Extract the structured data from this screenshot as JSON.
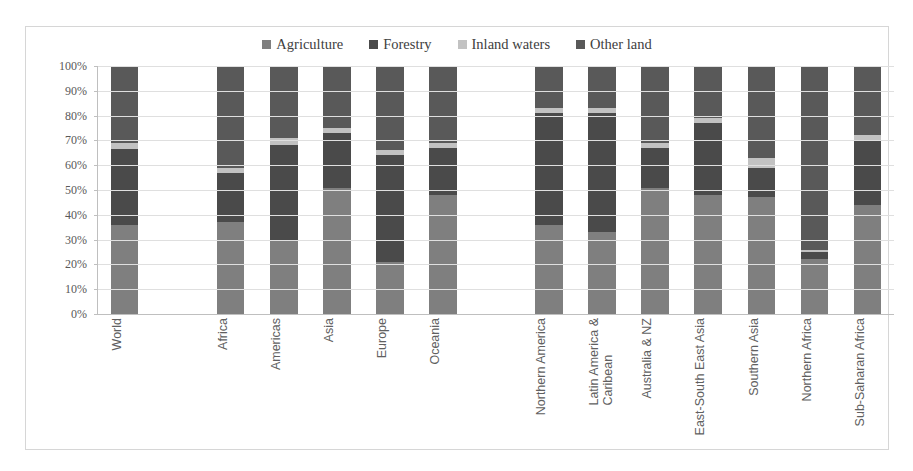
{
  "chart_data": {
    "type": "bar",
    "subtype": "stacked-percentage",
    "title": "",
    "xlabel": "",
    "ylabel": "",
    "ylim": [
      0,
      100
    ],
    "y_ticks": [
      "0%",
      "10%",
      "20%",
      "30%",
      "40%",
      "50%",
      "60%",
      "70%",
      "80%",
      "90%",
      "100%"
    ],
    "grid": true,
    "legend_position": "top",
    "categories": [
      "World",
      "",
      "Africa",
      "Americas",
      "Asia",
      "Europe",
      "Oceania",
      "",
      "Northern America",
      "Latin America &\nCaribean",
      "Australia & NZ",
      "East-South East Asia",
      "Southern Asia",
      "Northern Africa",
      "Sub-Saharan Africa"
    ],
    "series": [
      {
        "name": "Agriculture",
        "color": "#7F7F7F",
        "values": [
          36,
          null,
          37,
          30,
          51,
          21,
          48,
          null,
          36,
          33,
          51,
          48,
          47,
          22,
          44
        ]
      },
      {
        "name": "Forestry",
        "color": "#4A4A4A",
        "values": [
          30.5,
          null,
          20,
          38,
          22,
          43,
          19,
          null,
          45,
          48,
          16,
          29,
          12,
          3,
          26
        ]
      },
      {
        "name": "Inland waters",
        "color": "#C2C2C2",
        "values": [
          2.5,
          null,
          2,
          3,
          2,
          2,
          2,
          null,
          2,
          2,
          2,
          2,
          4,
          1,
          2
        ]
      },
      {
        "name": "Other land",
        "color": "#595959",
        "values": [
          31,
          null,
          41,
          29,
          25,
          34,
          31,
          null,
          17,
          17,
          31,
          21,
          37,
          74,
          28
        ]
      }
    ]
  },
  "legend": {
    "items": [
      {
        "label": "Agriculture",
        "color": "#7F7F7F"
      },
      {
        "label": "Forestry",
        "color": "#4A4A4A"
      },
      {
        "label": "Inland waters",
        "color": "#C2C2C2"
      },
      {
        "label": "Other land",
        "color": "#595959"
      }
    ]
  }
}
